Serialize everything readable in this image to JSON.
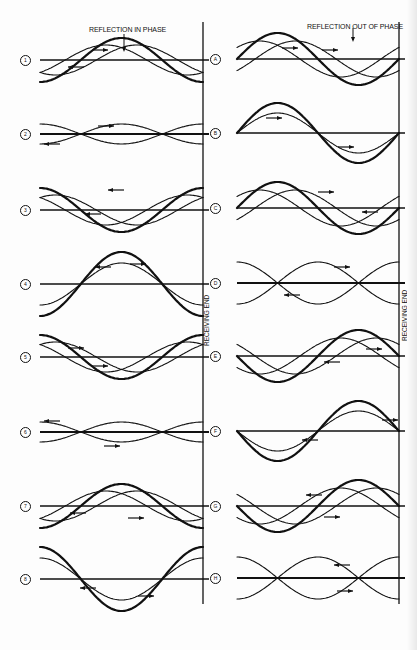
{
  "titles": {
    "left": "REFLECTION IN PHASE",
    "right": "REFLECTION OUT OF PHASE"
  },
  "receiving_end_label": "RECEIVING END",
  "left_panels": [
    {
      "label": "1",
      "baseline_y": 60
    },
    {
      "label": "2",
      "baseline_y": 134
    },
    {
      "label": "3",
      "baseline_y": 210
    },
    {
      "label": "4",
      "baseline_y": 284
    },
    {
      "label": "5",
      "baseline_y": 357
    },
    {
      "label": "6",
      "baseline_y": 432
    },
    {
      "label": "7",
      "baseline_y": 506
    },
    {
      "label": "8",
      "baseline_y": 579
    }
  ],
  "right_panels": [
    {
      "label": "A",
      "baseline_y": 59
    },
    {
      "label": "B",
      "baseline_y": 133
    },
    {
      "label": "C",
      "baseline_y": 208
    },
    {
      "label": "D",
      "baseline_y": 283
    },
    {
      "label": "E",
      "baseline_y": 356
    },
    {
      "label": "F",
      "baseline_y": 431
    },
    {
      "label": "G",
      "baseline_y": 506
    },
    {
      "label": "H",
      "baseline_y": 578
    }
  ]
}
